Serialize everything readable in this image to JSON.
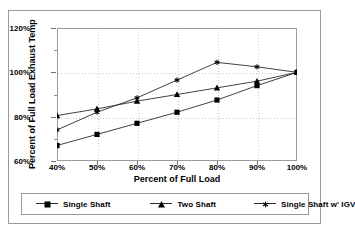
{
  "chart_data": {
    "type": "line",
    "title": "",
    "xlabel": "Percent of Full Load",
    "ylabel": "Percent of Full Load Exhaust Temp",
    "x": [
      40,
      50,
      60,
      70,
      80,
      90,
      100
    ],
    "xtick_labels": [
      "40%",
      "50%",
      "60%",
      "70%",
      "80%",
      "90%",
      "100%"
    ],
    "ytick_labels": [
      "60%",
      "80%",
      "100%",
      "120%"
    ],
    "yticks": [
      60,
      80,
      100,
      120
    ],
    "xlim": [
      40,
      100
    ],
    "ylim": [
      60,
      120
    ],
    "grid": true,
    "legend_position": "bottom",
    "series": [
      {
        "name": "Single Shaft",
        "marker": "square",
        "values": [
          67,
          72,
          77,
          82,
          87.5,
          94,
          100
        ]
      },
      {
        "name": "Two Shaft",
        "marker": "triangle",
        "values": [
          80.5,
          83.5,
          87,
          90,
          93,
          96,
          100
        ]
      },
      {
        "name": "Single Shaft w' IGV",
        "marker": "star",
        "values": [
          74,
          82,
          88.5,
          96.5,
          104.5,
          102.5,
          100
        ]
      }
    ]
  },
  "colors": {
    "series_line": "#2b2b2b",
    "marker": "#000000",
    "grid": "#c9c9c9",
    "axis": "#9c9c9c",
    "border": "#9a9a9a",
    "background": "#ffffff"
  }
}
